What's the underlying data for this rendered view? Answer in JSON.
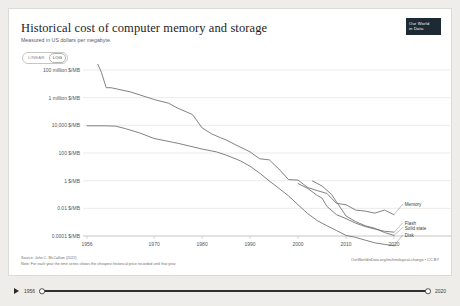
{
  "header": {
    "title": "Historical cost of computer memory and storage",
    "subtitle": "Measured in US dollars per megabyte.",
    "logo_line1": "Our World",
    "logo_line2": "in Data"
  },
  "scale_toggle": {
    "options": [
      "LINEAR",
      "LOG"
    ],
    "selected": "LOG"
  },
  "footer": {
    "source": "Source: John C. McCallum (2022)",
    "note": "Note: For each year the time series shows the cheapest historical price recorded until that year.",
    "attribution": "OurWorldInData.org/technological-change • CC BY"
  },
  "timeline": {
    "play_icon": "play-icon",
    "start_year": "1956",
    "end_year": "2020"
  },
  "chart_data": {
    "type": "line",
    "title": "Historical cost of computer memory and storage",
    "subtitle": "Measured in US dollars per megabyte.",
    "xlabel": "",
    "ylabel": "US dollars per megabyte",
    "yscale": "log",
    "xlim": [
      1956,
      2020
    ],
    "ylim": [
      0.0001,
      100000000
    ],
    "grid": true,
    "legend_position": "right-inline",
    "xticks": [
      1956,
      1970,
      1980,
      1990,
      2000,
      2010,
      2020
    ],
    "xtick_labels": [
      "1956",
      "1970",
      "1980",
      "1990",
      "2000",
      "2010",
      "2020"
    ],
    "yticks": [
      100000000,
      1000000,
      10000,
      100,
      1,
      0.01,
      0.0001
    ],
    "ytick_labels": [
      "100 million $/MB",
      "1 million $/MB",
      "10,000 $/MB",
      "100 $/MB",
      "1 $/MB",
      "0.01 $/MB",
      "0.0001 $/MB"
    ],
    "series": [
      {
        "name": "Memory",
        "color": "#6b6b6b",
        "label_x": 2021,
        "label_y": 0.02,
        "points": [
          [
            1956,
            411000000
          ],
          [
            1957,
            411000000
          ],
          [
            1958,
            411000000
          ],
          [
            1959,
            68000000
          ],
          [
            1960,
            5242880
          ],
          [
            1961,
            5242880
          ],
          [
            1965,
            2642000
          ],
          [
            1970,
            734000
          ],
          [
            1973,
            399000
          ],
          [
            1975,
            169000
          ],
          [
            1978,
            60000
          ],
          [
            1980,
            6480
          ],
          [
            1982,
            2400
          ],
          [
            1984,
            1200
          ],
          [
            1985,
            880
          ],
          [
            1987,
            390
          ],
          [
            1990,
            120
          ],
          [
            1992,
            38
          ],
          [
            1994,
            32
          ],
          [
            1996,
            7
          ],
          [
            1998,
            1.2
          ],
          [
            2000,
            1.1
          ],
          [
            2002,
            0.32
          ],
          [
            2004,
            0.19
          ],
          [
            2006,
            0.12
          ],
          [
            2008,
            0.023
          ],
          [
            2010,
            0.0182
          ],
          [
            2012,
            0.0075
          ],
          [
            2014,
            0.0063
          ],
          [
            2016,
            0.0045
          ],
          [
            2018,
            0.0075
          ],
          [
            2020,
            0.0035
          ]
        ]
      },
      {
        "name": "Disk",
        "color": "#6b6b6b",
        "label_x": 2021,
        "label_y": 0.00012,
        "points": [
          [
            1956,
            9200
          ],
          [
            1960,
            9200
          ],
          [
            1962,
            8700
          ],
          [
            1964,
            5800
          ],
          [
            1967,
            2800
          ],
          [
            1970,
            1120
          ],
          [
            1975,
            500
          ],
          [
            1980,
            193
          ],
          [
            1983,
            120
          ],
          [
            1985,
            70
          ],
          [
            1988,
            27
          ],
          [
            1990,
            11
          ],
          [
            1992,
            3.5
          ],
          [
            1994,
            0.95
          ],
          [
            1996,
            0.28
          ],
          [
            1998,
            0.08
          ],
          [
            2000,
            0.018
          ],
          [
            2002,
            0.0042
          ],
          [
            2004,
            0.0013
          ],
          [
            2006,
            0.00055
          ],
          [
            2008,
            0.00025
          ],
          [
            2010,
            0.00011
          ],
          [
            2012,
            8e-05
          ],
          [
            2014,
            5e-05
          ],
          [
            2016,
            3.2e-05
          ],
          [
            2018,
            2.5e-05
          ],
          [
            2020,
            1.96e-05
          ]
        ]
      },
      {
        "name": "Flash",
        "color": "#6b6b6b",
        "label_x": 2021,
        "label_y": 0.0009,
        "points": [
          [
            2000,
            0.62
          ],
          [
            2002,
            0.28
          ],
          [
            2004,
            0.085
          ],
          [
            2005,
            0.055
          ],
          [
            2006,
            0.014
          ],
          [
            2008,
            0.0035
          ],
          [
            2010,
            0.0018
          ],
          [
            2012,
            0.00085
          ],
          [
            2014,
            0.00048
          ],
          [
            2016,
            0.00032
          ],
          [
            2018,
            0.00022
          ],
          [
            2020,
            0.00019
          ]
        ]
      },
      {
        "name": "Solid state",
        "color": "#6b6b6b",
        "label_x": 2021,
        "label_y": 0.0004,
        "points": [
          [
            2003,
            0.95
          ],
          [
            2005,
            0.41
          ],
          [
            2007,
            0.1
          ],
          [
            2008,
            0.03
          ],
          [
            2010,
            0.0028
          ],
          [
            2012,
            0.0011
          ],
          [
            2014,
            0.00055
          ],
          [
            2016,
            0.00036
          ],
          [
            2018,
            0.00018
          ],
          [
            2020,
            0.00011
          ]
        ]
      }
    ]
  }
}
